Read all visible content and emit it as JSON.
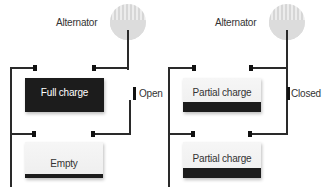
{
  "diagram": {
    "panels": [
      {
        "id": "left",
        "alternator_label": "Alternator",
        "switch_state": "Open",
        "batteries": [
          {
            "label": "Full charge",
            "state": "full",
            "fill_percent": 100
          },
          {
            "label": "Empty",
            "state": "empty",
            "fill_percent": 15
          }
        ]
      },
      {
        "id": "right",
        "alternator_label": "Alternator",
        "switch_state": "Closed",
        "batteries": [
          {
            "label": "Partial charge",
            "state": "partial",
            "fill_percent": 30
          },
          {
            "label": "Partial charge",
            "state": "partial",
            "fill_percent": 30
          }
        ]
      }
    ],
    "colors": {
      "wire": "#2a2a2a",
      "battery_dark": "#1c1c1c",
      "battery_light": "#f2f2f2",
      "alternator": "#dcdcdc"
    }
  }
}
